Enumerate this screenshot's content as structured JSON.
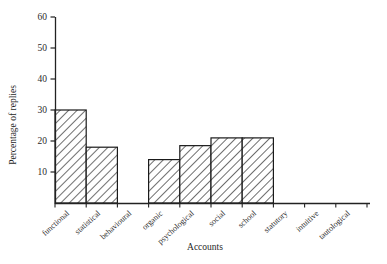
{
  "chart_data": {
    "type": "bar",
    "title": "",
    "xlabel": "Accounts",
    "ylabel": "Percentage of replies",
    "categories": [
      "functional",
      "statistical",
      "behavioural",
      "organic",
      "psychological",
      "social",
      "school",
      "statutory",
      "intuitive",
      "tautological"
    ],
    "values": [
      30,
      18,
      0,
      14,
      18.5,
      21,
      21,
      0,
      0,
      0
    ],
    "yticks": [
      10,
      20,
      30,
      40,
      50,
      60
    ],
    "ytick_labels": [
      "10",
      "20",
      "30",
      "40",
      "50",
      "60"
    ],
    "ylim": [
      0,
      60
    ],
    "grid": false,
    "legend": null,
    "bar_style": "hatched-diagonal",
    "colors": {
      "axis": "#222222",
      "bar_edge": "#1a1a1a",
      "bar_fill": "#ffffff",
      "hatch": "#4a4a4a",
      "background": "#ffffff"
    }
  }
}
